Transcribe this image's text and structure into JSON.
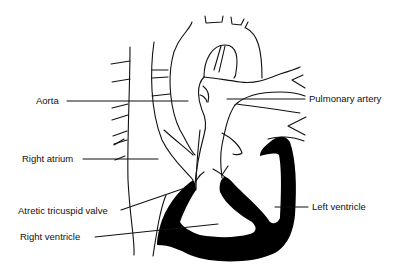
{
  "diagram": {
    "type": "anatomical-heart-diagram",
    "colors": {
      "line": "#111111",
      "fill": "#000000",
      "background": "#ffffff"
    },
    "labels": {
      "aorta": "Aorta",
      "pulmonary_artery": "Pulmonary artery",
      "right_atrium": "Right atrium",
      "atretic_tricuspid_valve": "Atretic tricuspid valve",
      "right_ventricle": "Right ventricle",
      "left_ventricle": "Left ventricle"
    }
  }
}
